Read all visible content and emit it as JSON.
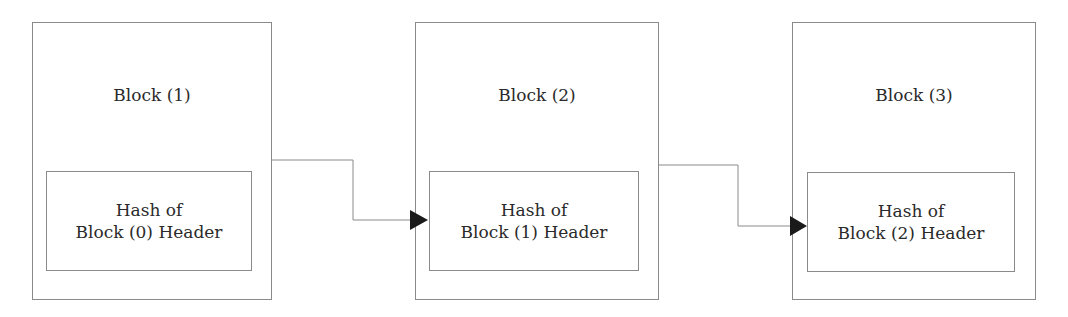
{
  "diagram": {
    "type": "blockchain-linked-blocks",
    "blocks": [
      {
        "title": "Block (1)",
        "hash_line1": "Hash of",
        "hash_line2": "Block (0) Header"
      },
      {
        "title": "Block (2)",
        "hash_line1": "Hash of",
        "hash_line2": "Block (1) Header"
      },
      {
        "title": "Block (3)",
        "hash_line1": "Hash of",
        "hash_line2": "Block (2) Header"
      }
    ],
    "connections": [
      {
        "from": "Block (1)",
        "to": "Block (2) hash field"
      },
      {
        "from": "Block (2)",
        "to": "Block (3) hash field"
      }
    ],
    "colors": {
      "line": "#8a8a8a",
      "arrowhead": "#1a1a1a",
      "text": "#2a2a2a"
    }
  }
}
